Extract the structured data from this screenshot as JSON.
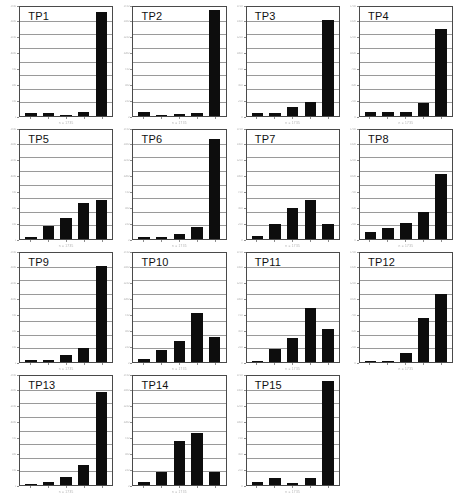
{
  "figure": {
    "layout": "4x4 grid of small-multiple bar charts",
    "panel_count": 15,
    "empty_cells": 1,
    "background_color": "#ffffff",
    "bar_color": "#0d0d0d",
    "gridline_color": "#9a9a9a",
    "axis_color": "#4a4a4a",
    "gridline_count": 7,
    "bars_per_panel": 5,
    "axis_label_legibility": "scanned low-resolution; tick labels are illegible"
  },
  "chart_data": [
    {
      "type": "bar",
      "title": "TP1",
      "categories": [
        "1",
        "2",
        "3",
        "4",
        "5"
      ],
      "values": [
        3,
        3,
        0.5,
        3.5,
        95
      ],
      "xlabel": "n = 1735",
      "ylabel": "",
      "ylim": [
        0,
        100
      ],
      "grid": true,
      "legend": "none"
    },
    {
      "type": "bar",
      "title": "TP2",
      "categories": [
        "1",
        "2",
        "3",
        "4",
        "5"
      ],
      "values": [
        4,
        0.8,
        2,
        3,
        97
      ],
      "xlabel": "n = 1735",
      "ylabel": "",
      "ylim": [
        0,
        100
      ],
      "grid": true,
      "legend": "none"
    },
    {
      "type": "bar",
      "title": "TP3",
      "categories": [
        "1",
        "2",
        "3",
        "4",
        "5"
      ],
      "values": [
        3,
        3,
        8,
        13,
        88
      ],
      "xlabel": "n = 1735",
      "ylabel": "",
      "ylim": [
        0,
        100
      ],
      "grid": true,
      "legend": "none"
    },
    {
      "type": "bar",
      "title": "TP4",
      "categories": [
        "1",
        "2",
        "3",
        "4",
        "5"
      ],
      "values": [
        4,
        4,
        4,
        12,
        80
      ],
      "xlabel": "n = 1735",
      "ylabel": "",
      "ylim": [
        0,
        100
      ],
      "grid": true,
      "legend": "none"
    },
    {
      "type": "bar",
      "title": "TP5",
      "categories": [
        "1",
        "2",
        "3",
        "4",
        "5"
      ],
      "values": [
        2,
        12,
        19,
        33,
        36
      ],
      "xlabel": "n = 1735",
      "ylabel": "",
      "ylim": [
        0,
        100
      ],
      "grid": true,
      "legend": "none"
    },
    {
      "type": "bar",
      "title": "TP6",
      "categories": [
        "1",
        "2",
        "3",
        "4",
        "5"
      ],
      "values": [
        2,
        2,
        5,
        11,
        92
      ],
      "xlabel": "n = 1735",
      "ylabel": "",
      "ylim": [
        0,
        100
      ],
      "grid": true,
      "legend": "none"
    },
    {
      "type": "bar",
      "title": "TP7",
      "categories": [
        "1",
        "2",
        "3",
        "4",
        "5"
      ],
      "values": [
        3,
        14,
        28,
        36,
        14
      ],
      "xlabel": "n = 1735",
      "ylabel": "",
      "ylim": [
        0,
        100
      ],
      "grid": true,
      "legend": "none"
    },
    {
      "type": "bar",
      "title": "TP8",
      "categories": [
        "1",
        "2",
        "3",
        "4",
        "5"
      ],
      "values": [
        6,
        10,
        15,
        25,
        60
      ],
      "xlabel": "n = 1735",
      "ylabel": "",
      "ylim": [
        0,
        100
      ],
      "grid": true,
      "legend": "none"
    },
    {
      "type": "bar",
      "title": "TP9",
      "categories": [
        "1",
        "2",
        "3",
        "4",
        "5"
      ],
      "values": [
        2,
        2,
        6,
        13,
        88
      ],
      "xlabel": "n = 1735",
      "ylabel": "",
      "ylim": [
        0,
        100
      ],
      "grid": true,
      "legend": "none"
    },
    {
      "type": "bar",
      "title": "TP10",
      "categories": [
        "1",
        "2",
        "3",
        "4",
        "5"
      ],
      "values": [
        3,
        11,
        19,
        45,
        23
      ],
      "xlabel": "n = 1735",
      "ylabel": "",
      "ylim": [
        0,
        100
      ],
      "grid": true,
      "legend": "none"
    },
    {
      "type": "bar",
      "title": "TP11",
      "categories": [
        "1",
        "2",
        "3",
        "4",
        "5"
      ],
      "values": [
        1,
        12,
        22,
        50,
        30
      ],
      "xlabel": "n = 1735",
      "ylabel": "",
      "ylim": [
        0,
        100
      ],
      "grid": true,
      "legend": "none"
    },
    {
      "type": "bar",
      "title": "TP12",
      "categories": [
        "1",
        "2",
        "3",
        "4",
        "5"
      ],
      "values": [
        1,
        1,
        8,
        40,
        62
      ],
      "xlabel": "n = 1735",
      "ylabel": "",
      "ylim": [
        0,
        100
      ],
      "grid": true,
      "legend": "none"
    },
    {
      "type": "bar",
      "title": "TP13",
      "categories": [
        "1",
        "2",
        "3",
        "4",
        "5"
      ],
      "values": [
        1,
        3,
        7,
        18,
        85
      ],
      "xlabel": "n = 1735",
      "ylabel": "",
      "ylim": [
        0,
        100
      ],
      "grid": true,
      "legend": "none"
    },
    {
      "type": "bar",
      "title": "TP14",
      "categories": [
        "1",
        "2",
        "3",
        "4",
        "5"
      ],
      "values": [
        3,
        12,
        40,
        48,
        12
      ],
      "xlabel": "n = 1735",
      "ylabel": "",
      "ylim": [
        0,
        100
      ],
      "grid": true,
      "legend": "none"
    },
    {
      "type": "bar",
      "title": "TP15",
      "categories": [
        "1",
        "2",
        "3",
        "4",
        "5"
      ],
      "values": [
        3,
        6,
        2,
        6,
        95
      ],
      "xlabel": "n = 1735",
      "ylabel": "",
      "ylim": [
        0,
        100
      ],
      "grid": true,
      "legend": "none"
    }
  ],
  "y_tick_labels": [
    "1750",
    "1500",
    "1250",
    "1000",
    "750",
    "500",
    "250",
    "0"
  ]
}
